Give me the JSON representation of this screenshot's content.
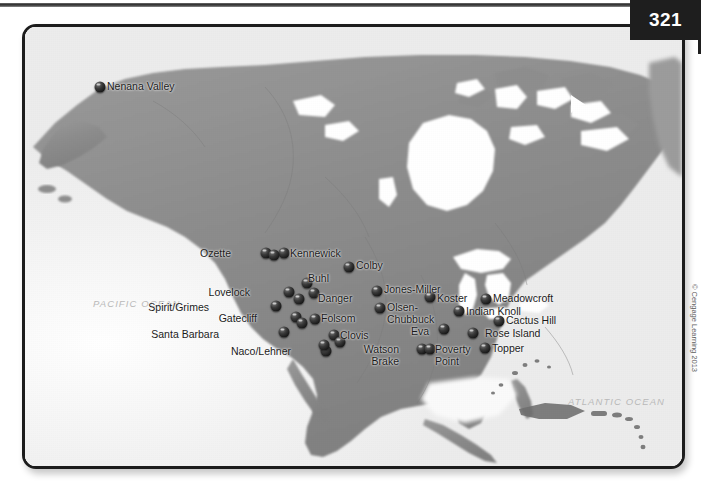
{
  "page": {
    "number": "321"
  },
  "credit": {
    "text": "© Cengage Learning 2013"
  },
  "map": {
    "title": "North America archaeological sites",
    "ocean_labels": [
      {
        "name": "pacific-ocean-label",
        "text": "PACIFIC OCEAN"
      },
      {
        "name": "atlantic-ocean-label",
        "text": "ATLANTIC OCEAN"
      }
    ],
    "colors": {
      "land": "#8e8e8e",
      "water": "#ffffff",
      "ocean": "#f2f2f2",
      "marker": "#141414",
      "frame": "#1c1c1c",
      "badge": "#1e1e1e"
    },
    "sites": [
      {
        "label": "Nenana Valley",
        "lx": 104,
        "ly": 78,
        "anchor": "left",
        "mx": 97,
        "my": 84
      },
      {
        "label": "Ozette",
        "lx": 228,
        "ly": 245,
        "anchor": "right",
        "mx": 263,
        "my": 250
      },
      {
        "label": "Kennewick",
        "lx": 287,
        "ly": 245,
        "anchor": "left",
        "mx": 281,
        "my": 250
      },
      {
        "label": "Colby",
        "lx": 353,
        "ly": 257,
        "anchor": "left",
        "mx": 346,
        "my": 264
      },
      {
        "label": "Buhl",
        "lx": 305,
        "ly": 270,
        "anchor": "left",
        "mx": 304,
        "my": 280
      },
      {
        "label": "Jones-Miller",
        "lx": 381,
        "ly": 281,
        "anchor": "left",
        "mx": 374,
        "my": 288
      },
      {
        "label": "Lovelock",
        "lx": 247,
        "ly": 284,
        "anchor": "right",
        "mx": 286,
        "my": 289
      },
      {
        "label": "Danger",
        "lx": 315,
        "ly": 290,
        "anchor": "left",
        "mx": 311,
        "my": 290
      },
      {
        "label": "Koster",
        "lx": 434,
        "ly": 290,
        "anchor": "left",
        "mx": 427,
        "my": 294
      },
      {
        "label": "Meadowcroft",
        "lx": 490,
        "ly": 290,
        "anchor": "left",
        "mx": 483,
        "my": 296
      },
      {
        "label": "Spirit/Grimes",
        "lx": 206,
        "ly": 299,
        "anchor": "right",
        "mx": 273,
        "my": 303
      },
      {
        "label": "Olsen-\nChubbuck",
        "lx": 384,
        "ly": 299,
        "anchor": "left",
        "mx": 377,
        "my": 305
      },
      {
        "label": "Indian Knoll",
        "lx": 463,
        "ly": 303,
        "anchor": "left",
        "mx": 456,
        "my": 308
      },
      {
        "label": "Gatecliff",
        "lx": 254,
        "ly": 310,
        "anchor": "right",
        "mx": 293,
        "my": 314
      },
      {
        "label": "Folsom",
        "lx": 318,
        "ly": 310,
        "anchor": "left",
        "mx": 312,
        "my": 316
      },
      {
        "label": "Cactus Hill",
        "lx": 503,
        "ly": 312,
        "anchor": "left",
        "mx": 496,
        "my": 318
      },
      {
        "label": "Eva",
        "lx": 426,
        "ly": 323,
        "anchor": "right",
        "mx": 441,
        "my": 326
      },
      {
        "label": "Rose Island",
        "lx": 482,
        "ly": 325,
        "anchor": "left",
        "mx": 470,
        "my": 330
      },
      {
        "label": "Santa Barbara",
        "lx": 216,
        "ly": 326,
        "anchor": "right",
        "mx": 281,
        "my": 329
      },
      {
        "label": "Clovis",
        "lx": 337,
        "ly": 327,
        "anchor": "left",
        "mx": 331,
        "my": 332
      },
      {
        "label": "Topper",
        "lx": 489,
        "ly": 340,
        "anchor": "left",
        "mx": 482,
        "my": 345
      },
      {
        "label": "Watson\nBrake",
        "lx": 396,
        "ly": 341,
        "anchor": "right",
        "mx": 419,
        "my": 346
      },
      {
        "label": "Poverty\nPoint",
        "lx": 432,
        "ly": 341,
        "anchor": "left",
        "mx": 427,
        "my": 346
      },
      {
        "label": "Naco/Lehner",
        "lx": 288,
        "ly": 343,
        "anchor": "right",
        "mx": 323,
        "my": 348
      }
    ],
    "extra_markers": [
      {
        "name": "marker-ozette-2",
        "mx": 271,
        "my": 252
      },
      {
        "name": "marker-danger-2",
        "mx": 296,
        "my": 296
      },
      {
        "name": "marker-gatecliff-2",
        "mx": 299,
        "my": 320
      },
      {
        "name": "marker-folsom-2",
        "mx": 337,
        "my": 339
      },
      {
        "name": "marker-clovis-2",
        "mx": 321,
        "my": 342
      }
    ]
  }
}
